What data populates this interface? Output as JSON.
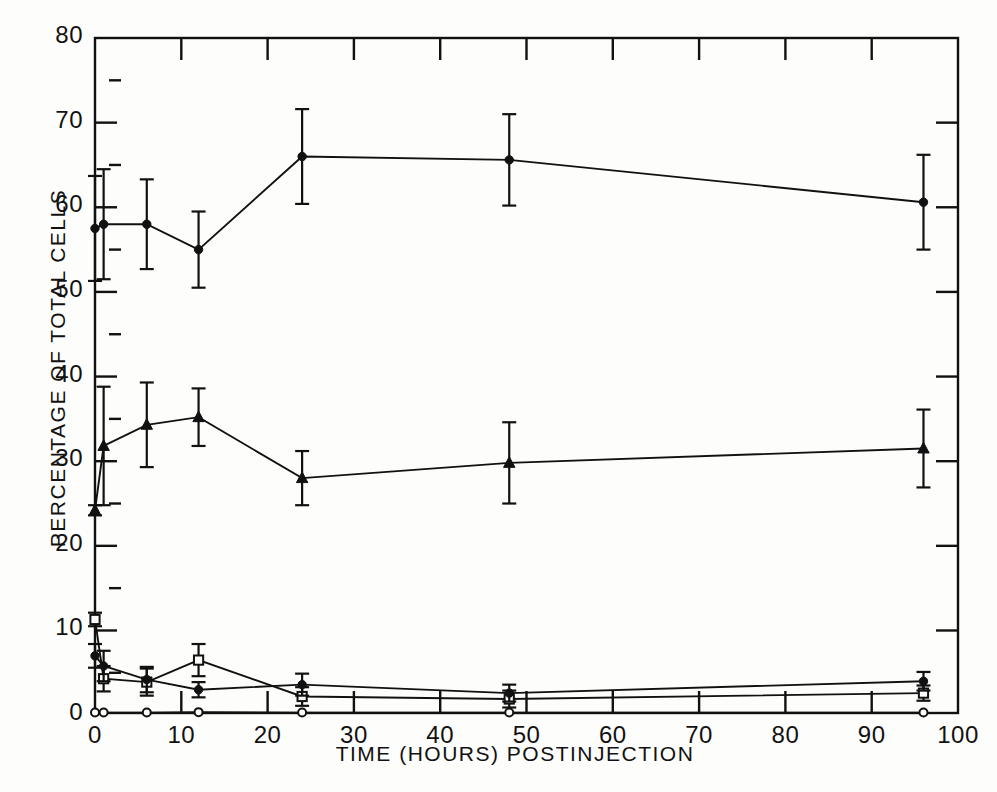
{
  "figure": {
    "title": "",
    "xlabel": "TIME (HOURS)  POSTINJECTION",
    "ylabel": "PERCENTAGE  OF  TOTAL  CELLS",
    "xticks": [
      "0",
      "10",
      "20",
      "30",
      "40",
      "50",
      "60",
      "70",
      "80",
      "90",
      "100"
    ],
    "yticks": [
      "0",
      "10",
      "20",
      "30",
      "40",
      "50",
      "60",
      "70",
      "80"
    ],
    "ink_color": "#111111",
    "background_color": "#fdfdfb"
  },
  "chart_data": {
    "type": "line",
    "title": "",
    "xlabel": "TIME (HOURS) POSTINJECTION",
    "ylabel": "PERCENTAGE OF TOTAL CELLS",
    "xlim": [
      0,
      100
    ],
    "ylim": [
      0,
      80
    ],
    "xticks": [
      0,
      10,
      20,
      30,
      40,
      50,
      60,
      70,
      80,
      90,
      100
    ],
    "yticks": [
      0,
      10,
      20,
      30,
      40,
      50,
      60,
      70,
      80
    ],
    "grid": false,
    "legend": "none",
    "error_bars": "standard deviation",
    "series": [
      {
        "name": "series-1-filled-circle-high",
        "marker": "filled-circle",
        "x": [
          0,
          1,
          6,
          12,
          24,
          48,
          96
        ],
        "values": [
          57.5,
          58.0,
          58.0,
          55.0,
          66.0,
          65.6,
          60.6
        ],
        "err_low": [
          6.2,
          6.5,
          5.3,
          4.5,
          5.6,
          5.4,
          5.6
        ],
        "err_high": [
          6.2,
          6.5,
          5.3,
          4.5,
          5.6,
          5.4,
          5.6
        ]
      },
      {
        "name": "series-2-filled-triangle",
        "marker": "filled-triangle",
        "x": [
          0,
          1,
          6,
          12,
          24,
          48,
          96
        ],
        "values": [
          24.2,
          31.8,
          34.3,
          35.2,
          28.0,
          29.8,
          31.5
        ],
        "err_low": [
          0.6,
          7.0,
          5.0,
          3.4,
          3.2,
          4.8,
          4.6
        ],
        "err_high": [
          0.6,
          7.0,
          5.0,
          3.4,
          3.2,
          4.8,
          4.6
        ]
      },
      {
        "name": "series-3-open-square",
        "marker": "open-square",
        "x": [
          0,
          1,
          6,
          12,
          24,
          48,
          96
        ],
        "values": [
          11.3,
          4.3,
          3.9,
          6.5,
          2.2,
          1.9,
          2.6
        ],
        "err_low": [
          0.8,
          1.5,
          1.6,
          1.9,
          1.1,
          1.0,
          0.9
        ],
        "err_high": [
          0.8,
          1.5,
          1.6,
          1.9,
          1.1,
          1.0,
          0.9
        ]
      },
      {
        "name": "series-4-filled-circle-low",
        "marker": "filled-circle",
        "x": [
          0,
          1,
          6,
          12,
          24,
          48,
          96
        ],
        "values": [
          7.0,
          5.8,
          4.2,
          3.0,
          3.6,
          2.6,
          4.0
        ],
        "err_low": [
          1.4,
          1.8,
          1.5,
          0.9,
          1.3,
          1.0,
          1.1
        ],
        "err_high": [
          1.4,
          1.8,
          1.5,
          0.9,
          1.3,
          1.0,
          1.1
        ]
      },
      {
        "name": "series-5-open-circle-baseline",
        "marker": "open-circle",
        "x": [
          0,
          1,
          6,
          12,
          24,
          48,
          96
        ],
        "values": [
          0.3,
          0.3,
          0.3,
          0.35,
          0.3,
          0.3,
          0.3
        ],
        "err_low": [
          0,
          0,
          0,
          0,
          0,
          0,
          0
        ],
        "err_high": [
          0,
          0,
          0,
          0,
          0,
          0,
          0
        ]
      }
    ]
  }
}
